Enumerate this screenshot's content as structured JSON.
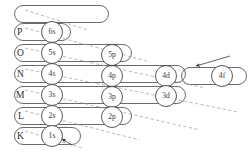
{
  "diagram": {
    "shell_labels": [
      {
        "name": "P",
        "text": "P",
        "x": 17,
        "y": 33
      },
      {
        "name": "O",
        "text": "O",
        "x": 17,
        "y": 54
      },
      {
        "name": "N",
        "text": "N",
        "x": 17,
        "y": 75
      },
      {
        "name": "M",
        "text": "M",
        "x": 16,
        "y": 96
      },
      {
        "name": "L",
        "text": "L",
        "x": 18,
        "y": 117
      },
      {
        "name": "K",
        "text": "K",
        "x": 17,
        "y": 137
      }
    ],
    "orbitals": [
      {
        "name": "6s",
        "text": "6s",
        "cx": 52,
        "cy": 32,
        "r": 10.5
      },
      {
        "name": "5s",
        "text": "5s",
        "cx": 52,
        "cy": 53,
        "r": 10.5
      },
      {
        "name": "4s",
        "text": "4s",
        "cx": 52,
        "cy": 74,
        "r": 10.5
      },
      {
        "name": "3s",
        "text": "3s",
        "cx": 52,
        "cy": 95,
        "r": 10.5
      },
      {
        "name": "2s",
        "text": "2s",
        "cx": 52,
        "cy": 116,
        "r": 10.5
      },
      {
        "name": "1s",
        "text": "1s",
        "cx": 52,
        "cy": 136,
        "r": 10.5
      },
      {
        "name": "5p",
        "text": "5p",
        "cx": 112,
        "cy": 55,
        "r": 10.5
      },
      {
        "name": "4p",
        "text": "4p",
        "cx": 112,
        "cy": 76,
        "r": 10.5
      },
      {
        "name": "3p",
        "text": "3p",
        "cx": 112,
        "cy": 97,
        "r": 10.5
      },
      {
        "name": "2p",
        "text": "2p",
        "cx": 112,
        "cy": 117,
        "r": 10.5
      },
      {
        "name": "4d",
        "text": "4d",
        "cx": 166,
        "cy": 76,
        "r": 10.5
      },
      {
        "name": "3d",
        "text": "3d",
        "cx": 166,
        "cy": 96,
        "r": 10.5
      },
      {
        "name": "4f",
        "text": "4f",
        "cx": 222,
        "cy": 76,
        "r": 10.5
      }
    ],
    "shell_tracks": [
      {
        "name": "track-6s",
        "x1": 23,
        "x2": 62,
        "cy": 32
      },
      {
        "name": "track-5s",
        "x1": 23,
        "x2": 123,
        "cy": 53
      },
      {
        "name": "track-4s",
        "x1": 23,
        "x2": 177,
        "cy": 74
      },
      {
        "name": "track-3s",
        "x1": 23,
        "x2": 177,
        "cy": 95
      },
      {
        "name": "track-2s",
        "x1": 23,
        "x2": 123,
        "cy": 116
      },
      {
        "name": "track-1s",
        "x1": 23,
        "x2": 72,
        "cy": 136
      },
      {
        "name": "track-top",
        "x1": 23,
        "x2": 100,
        "cy": 14
      },
      {
        "name": "track-4f",
        "x1": 190,
        "x2": 238,
        "cy": 76
      }
    ],
    "diagonals": [
      {
        "name": "diagonal-1",
        "x1": 25,
        "y1": 10,
        "x2": 88,
        "y2": 30
      },
      {
        "name": "diagonal-2",
        "x1": 25,
        "y1": 28,
        "x2": 150,
        "y2": 62
      },
      {
        "name": "diagonal-3",
        "x1": 25,
        "y1": 48,
        "x2": 205,
        "y2": 88
      },
      {
        "name": "diagonal-4",
        "x1": 25,
        "y1": 69,
        "x2": 238,
        "y2": 112
      },
      {
        "name": "diagonal-5",
        "x1": 25,
        "y1": 90,
        "x2": 200,
        "y2": 130
      },
      {
        "name": "diagonal-6",
        "x1": 25,
        "y1": 111,
        "x2": 140,
        "y2": 140
      },
      {
        "name": "diagonal-7",
        "x1": 25,
        "y1": 131,
        "x2": 82,
        "y2": 148
      }
    ],
    "arrows": [
      {
        "name": "arrow-1s",
        "x1": 72,
        "y1": 145,
        "x2": 62,
        "y2": 139
      },
      {
        "name": "arrow-4f",
        "x1": 230,
        "y1": 56,
        "x2": 196,
        "y2": 66
      }
    ],
    "colors": {
      "ink": "#3a3a3a",
      "dash": "#9a9a9a",
      "background": "#ffffff"
    }
  }
}
